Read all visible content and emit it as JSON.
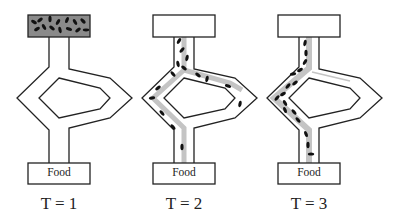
{
  "figure": {
    "panels": [
      {
        "id": "t1",
        "time_label": "T = 1",
        "food_label": "Food",
        "state": "ants in nest",
        "shortest_path": "none",
        "offset_x": 0
      },
      {
        "id": "t2",
        "time_label": "T = 2",
        "food_label": "Food",
        "state": "ants exploring both branches",
        "shortest_path": "both",
        "offset_x": 125
      },
      {
        "id": "t3",
        "time_label": "T = 3",
        "food_label": "Food",
        "state": "ants converge on short (left) branch",
        "shortest_path": "left",
        "offset_x": 250
      }
    ],
    "colors": {
      "outline": "#222222",
      "nest_fill_t1": "#8a8a8a",
      "pheromone_trail": "#c4c4c4",
      "ant": "#111111",
      "background": "#ffffff"
    }
  }
}
